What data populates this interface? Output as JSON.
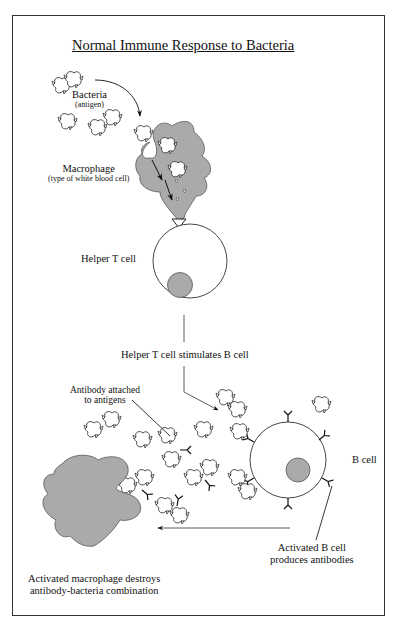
{
  "title": "Normal Immune Response to Bacteria",
  "labels": {
    "bacteria": "Bacteria",
    "bacteria_sub": "(antigen)",
    "macrophage": "Macrophage",
    "macrophage_sub": "(type of white blood cell)",
    "helper_t": "Helper T cell",
    "stimulates": "Helper T cell stimulates B cell",
    "antibody_attached_1": "Antibody attached",
    "antibody_attached_2": "to antigens",
    "b_cell": "B cell",
    "activated_b_1": "Activated B cell",
    "activated_b_2": "produces antibodies",
    "destroys_1": "Activated macrophage destroys",
    "destroys_2": "antibody-bacteria combination"
  },
  "colors": {
    "cell_fill": "#aaaaaa",
    "outline": "#333333",
    "background": "#ffffff"
  }
}
